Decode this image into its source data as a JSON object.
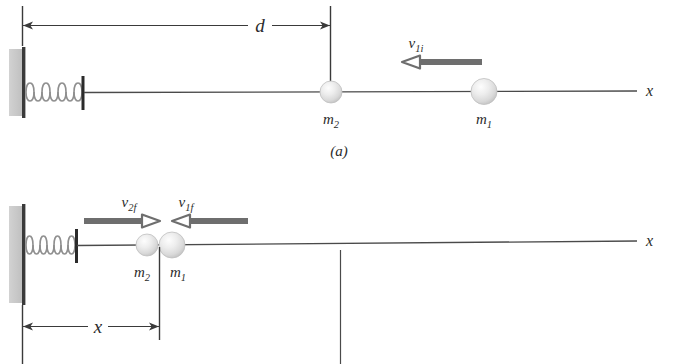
{
  "figure": {
    "panels": [
      {
        "id": "a",
        "caption": "(a)",
        "dimension": {
          "label": "d"
        },
        "axis_label": "x",
        "masses": [
          {
            "name": "m",
            "subscript": "2"
          },
          {
            "name": "m",
            "subscript": "1"
          }
        ],
        "velocities": [
          {
            "name": "v",
            "subscript": "1i",
            "direction": "left"
          }
        ]
      },
      {
        "id": "b",
        "caption": "(b)",
        "dimension": {
          "label": "x"
        },
        "axis_label": "x",
        "masses": [
          {
            "name": "m",
            "subscript": "2"
          },
          {
            "name": "m",
            "subscript": "1"
          }
        ],
        "velocities": [
          {
            "name": "v",
            "subscript": "2f",
            "direction": "right"
          },
          {
            "name": "v",
            "subscript": "1f",
            "direction": "left"
          }
        ]
      }
    ],
    "colors": {
      "wall_fill": "#c9c9c9",
      "wall_edge": "#3a3a3a",
      "spring": "#8f8f8f",
      "axis": "#4a4a4a",
      "velocity_arrow": "#6e6e6e",
      "dimension_line": "#3a3a3a",
      "ball_light": "#f2f2f2",
      "ball_mid": "#d8d8d8",
      "ball_edge": "#b5b5b5",
      "text": "#2b2b2b",
      "background": "#ffffff"
    }
  }
}
